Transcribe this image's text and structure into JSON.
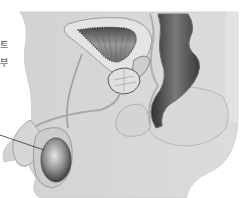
{
  "figure": {
    "style": "grayscale",
    "colors": {
      "background": "#ffffff",
      "body_tissue": "#d6d6d6",
      "body_edge": "#c4c4c4",
      "organ_outline": "#8a8a8a",
      "dark_shading": "#3c3c3c",
      "leader_line": "#444444"
    },
    "labels": [
      {
        "text": "트",
        "note": "cut off at left edge"
      },
      {
        "text": "부",
        "note": "cut off at left edge"
      }
    ],
    "structures": [
      "bladder",
      "prostate",
      "seminal-vesicle",
      "rectum",
      "vas-deferens",
      "penis",
      "testis",
      "buttock"
    ],
    "leader_line_target": "testis"
  }
}
